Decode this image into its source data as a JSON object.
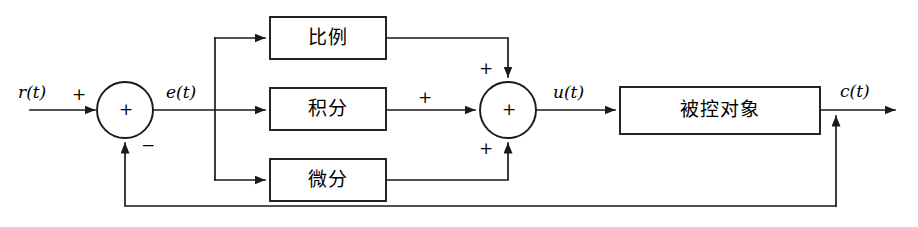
{
  "diagram": {
    "type": "control-system-block-diagram",
    "blocks": [
      {
        "id": "proportional",
        "label": "比例"
      },
      {
        "id": "integral",
        "label": "积分"
      },
      {
        "id": "derivative",
        "label": "微分"
      },
      {
        "id": "plant",
        "label": "被控对象"
      }
    ],
    "signals": [
      {
        "id": "reference",
        "label": "r(t)"
      },
      {
        "id": "error",
        "label": "e(t)"
      },
      {
        "id": "control",
        "label": "u(t)"
      },
      {
        "id": "output",
        "label": "c(t)"
      }
    ],
    "summers": [
      {
        "id": "error-summer",
        "center_sign": "+",
        "input_signs": [
          {
            "id": "reference-sign",
            "sign": "+"
          },
          {
            "id": "feedback-sign",
            "sign": "−"
          }
        ]
      },
      {
        "id": "control-summer",
        "center_sign": "+",
        "input_signs": [
          {
            "id": "proportional-sign",
            "sign": "+"
          },
          {
            "id": "integral-sign",
            "sign": "+"
          },
          {
            "id": "derivative-sign",
            "sign": "+"
          }
        ]
      }
    ],
    "colors": {
      "line": "#1a1a1a",
      "background": "#ffffff",
      "text": "#000000"
    }
  }
}
